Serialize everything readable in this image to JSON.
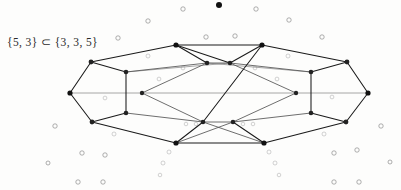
{
  "figure": {
    "caption": "{5, 3} ⊂ {3, 3, 5}",
    "colors": {
      "edge_dark": "#1a1a1a",
      "edge_mid": "#545454",
      "edge_light": "#8a8a8a",
      "node": "#111111",
      "background_circle": "#8d8d8d",
      "page_background": "#fdfdfc"
    },
    "graph": {
      "description": "Schlegel-style planar projection of the dodecahedron {5,3} drawn inside the 600-cell {3,3,5}",
      "vertex_count": 28,
      "nodes": [
        {
          "id": "L",
          "x": 70,
          "y": 93,
          "r": 2.6,
          "tone": "dark"
        },
        {
          "id": "LUO",
          "x": 91,
          "y": 62,
          "r": 2.4,
          "tone": "dark"
        },
        {
          "id": "LLO",
          "x": 92,
          "y": 122,
          "r": 2.4,
          "tone": "dark"
        },
        {
          "id": "TL",
          "x": 176,
          "y": 45,
          "r": 2.6,
          "tone": "dark"
        },
        {
          "id": "BL",
          "x": 176,
          "y": 143,
          "r": 2.6,
          "tone": "dark"
        },
        {
          "id": "LUI",
          "x": 126,
          "y": 72,
          "r": 2.3,
          "tone": "dark"
        },
        {
          "id": "LLI",
          "x": 126,
          "y": 113,
          "r": 2.3,
          "tone": "dark"
        },
        {
          "id": "LMI",
          "x": 142,
          "y": 93,
          "r": 2.2,
          "tone": "dark"
        },
        {
          "id": "CTL",
          "x": 207,
          "y": 63,
          "r": 2.3,
          "tone": "dark"
        },
        {
          "id": "CTR",
          "x": 230,
          "y": 63,
          "r": 2.3,
          "tone": "dark"
        },
        {
          "id": "CBL",
          "x": 203,
          "y": 122,
          "r": 2.3,
          "tone": "dark"
        },
        {
          "id": "CBR",
          "x": 233,
          "y": 122,
          "r": 2.3,
          "tone": "dark"
        },
        {
          "id": "TR",
          "x": 262,
          "y": 45,
          "r": 2.6,
          "tone": "dark"
        },
        {
          "id": "BR",
          "x": 264,
          "y": 143,
          "r": 2.6,
          "tone": "dark"
        },
        {
          "id": "RUI",
          "x": 311,
          "y": 72,
          "r": 2.3,
          "tone": "dark"
        },
        {
          "id": "RLI",
          "x": 311,
          "y": 113,
          "r": 2.3,
          "tone": "dark"
        },
        {
          "id": "RMI",
          "x": 296,
          "y": 93,
          "r": 2.2,
          "tone": "dark"
        },
        {
          "id": "RUO",
          "x": 347,
          "y": 62,
          "r": 2.4,
          "tone": "dark"
        },
        {
          "id": "RLO",
          "x": 346,
          "y": 122,
          "r": 2.4,
          "tone": "dark"
        },
        {
          "id": "R",
          "x": 368,
          "y": 93,
          "r": 2.6,
          "tone": "dark"
        }
      ],
      "edges": [
        {
          "from": "L",
          "to": "LUO",
          "tone": "dark"
        },
        {
          "from": "LUO",
          "to": "TL",
          "tone": "dark"
        },
        {
          "from": "TL",
          "to": "TR",
          "tone": "dark"
        },
        {
          "from": "TR",
          "to": "RUO",
          "tone": "dark"
        },
        {
          "from": "RUO",
          "to": "R",
          "tone": "dark"
        },
        {
          "from": "R",
          "to": "RLO",
          "tone": "dark"
        },
        {
          "from": "RLO",
          "to": "BR",
          "tone": "dark"
        },
        {
          "from": "BR",
          "to": "BL",
          "tone": "dark"
        },
        {
          "from": "BL",
          "to": "LLO",
          "tone": "dark"
        },
        {
          "from": "LLO",
          "to": "L",
          "tone": "dark"
        },
        {
          "from": "LUO",
          "to": "LUI",
          "tone": "dark"
        },
        {
          "from": "LLO",
          "to": "LLI",
          "tone": "dark"
        },
        {
          "from": "LUI",
          "to": "LLI",
          "tone": "dark"
        },
        {
          "from": "L",
          "to": "LMI",
          "tone": "light"
        },
        {
          "from": "LUI",
          "to": "CTL",
          "tone": "mid"
        },
        {
          "from": "LLI",
          "to": "CBL",
          "tone": "mid"
        },
        {
          "from": "LMI",
          "to": "CTL",
          "tone": "mid"
        },
        {
          "from": "LMI",
          "to": "CBL",
          "tone": "mid"
        },
        {
          "from": "TL",
          "to": "CTL",
          "tone": "dark"
        },
        {
          "from": "BL",
          "to": "CBL",
          "tone": "dark"
        },
        {
          "from": "CTL",
          "to": "CTR",
          "tone": "mid"
        },
        {
          "from": "CBL",
          "to": "CBR",
          "tone": "mid"
        },
        {
          "from": "RUO",
          "to": "RUI",
          "tone": "dark"
        },
        {
          "from": "RLO",
          "to": "RLI",
          "tone": "dark"
        },
        {
          "from": "RUI",
          "to": "RLI",
          "tone": "dark"
        },
        {
          "from": "R",
          "to": "RMI",
          "tone": "light"
        },
        {
          "from": "RUI",
          "to": "CTR",
          "tone": "mid"
        },
        {
          "from": "RLI",
          "to": "CBR",
          "tone": "mid"
        },
        {
          "from": "RMI",
          "to": "CTR",
          "tone": "mid"
        },
        {
          "from": "RMI",
          "to": "CBR",
          "tone": "mid"
        },
        {
          "from": "TR",
          "to": "CTR",
          "tone": "dark"
        },
        {
          "from": "BR",
          "to": "CBR",
          "tone": "dark"
        },
        {
          "from": "TL",
          "to": "CTR",
          "tone": "dark"
        },
        {
          "from": "TR",
          "to": "CBL",
          "tone": "dark"
        },
        {
          "from": "BL",
          "to": "CBR",
          "tone": "mid"
        },
        {
          "from": "BR",
          "to": "CBL",
          "tone": "mid"
        },
        {
          "from": "LMI",
          "to": "RMI",
          "tone": "light"
        },
        {
          "from": "LUI",
          "to": "CTR",
          "tone": "light"
        },
        {
          "from": "RUI",
          "to": "CTL",
          "tone": "light"
        }
      ]
    },
    "background_marks": {
      "solid_dots": [
        {
          "x": 219,
          "y": 5,
          "r": 3.0
        }
      ],
      "open_circles": [
        {
          "x": 183,
          "y": 9,
          "r": 2.2,
          "faint": false
        },
        {
          "x": 256,
          "y": 9,
          "r": 2.2,
          "faint": false
        },
        {
          "x": 148,
          "y": 21,
          "r": 2.2,
          "faint": false
        },
        {
          "x": 289,
          "y": 20,
          "r": 2.2,
          "faint": false
        },
        {
          "x": 118,
          "y": 38,
          "r": 2.2,
          "faint": false
        },
        {
          "x": 206,
          "y": 37,
          "r": 2.2,
          "faint": false
        },
        {
          "x": 235,
          "y": 36,
          "r": 2.2,
          "faint": false
        },
        {
          "x": 322,
          "y": 37,
          "r": 2.2,
          "faint": false
        },
        {
          "x": 148,
          "y": 56,
          "r": 2.0,
          "faint": true
        },
        {
          "x": 288,
          "y": 56,
          "r": 2.0,
          "faint": true
        },
        {
          "x": 183,
          "y": 68,
          "r": 1.9,
          "faint": true
        },
        {
          "x": 255,
          "y": 68,
          "r": 1.9,
          "faint": true
        },
        {
          "x": 159,
          "y": 79,
          "r": 1.9,
          "faint": true
        },
        {
          "x": 277,
          "y": 79,
          "r": 1.9,
          "faint": true
        },
        {
          "x": 105,
          "y": 98,
          "r": 1.9,
          "faint": true
        },
        {
          "x": 332,
          "y": 97,
          "r": 1.9,
          "faint": true
        },
        {
          "x": 55,
          "y": 126,
          "r": 2.2,
          "faint": false
        },
        {
          "x": 381,
          "y": 126,
          "r": 2.2,
          "faint": false
        },
        {
          "x": 114,
          "y": 134,
          "r": 2.0,
          "faint": true
        },
        {
          "x": 324,
          "y": 134,
          "r": 2.0,
          "faint": true
        },
        {
          "x": 186,
          "y": 124,
          "r": 1.8,
          "faint": true
        },
        {
          "x": 196,
          "y": 124,
          "r": 1.8,
          "faint": true
        },
        {
          "x": 243,
          "y": 124,
          "r": 1.8,
          "faint": true
        },
        {
          "x": 253,
          "y": 124,
          "r": 1.8,
          "faint": true
        },
        {
          "x": 82,
          "y": 153,
          "r": 2.2,
          "faint": false
        },
        {
          "x": 105,
          "y": 155,
          "r": 2.2,
          "faint": false
        },
        {
          "x": 169,
          "y": 152,
          "r": 2.0,
          "faint": true
        },
        {
          "x": 269,
          "y": 152,
          "r": 2.0,
          "faint": true
        },
        {
          "x": 334,
          "y": 153,
          "r": 2.2,
          "faint": false
        },
        {
          "x": 357,
          "y": 150,
          "r": 2.2,
          "faint": false
        },
        {
          "x": 48,
          "y": 163,
          "r": 2.0,
          "faint": false
        },
        {
          "x": 163,
          "y": 163,
          "r": 2.0,
          "faint": true
        },
        {
          "x": 275,
          "y": 163,
          "r": 2.0,
          "faint": true
        },
        {
          "x": 390,
          "y": 162,
          "r": 2.0,
          "faint": false
        },
        {
          "x": 160,
          "y": 175,
          "r": 1.8,
          "faint": true
        },
        {
          "x": 279,
          "y": 175,
          "r": 1.8,
          "faint": true
        },
        {
          "x": 78,
          "y": 182,
          "r": 2.2,
          "faint": false
        },
        {
          "x": 103,
          "y": 182,
          "r": 2.2,
          "faint": false
        },
        {
          "x": 334,
          "y": 182,
          "r": 2.2,
          "faint": false
        },
        {
          "x": 359,
          "y": 182,
          "r": 2.2,
          "faint": false
        }
      ]
    }
  }
}
